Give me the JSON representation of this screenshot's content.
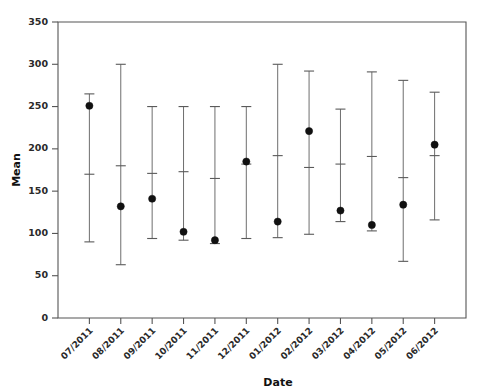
{
  "chart_data": {
    "type": "scatter",
    "title": "",
    "xlabel": "Date",
    "ylabel": "Mean",
    "grid": false,
    "legend": null,
    "ylim": [
      0,
      350
    ],
    "ytick_step": 50,
    "yticks": [
      0,
      50,
      100,
      150,
      200,
      250,
      300,
      350
    ],
    "ytick_labels": [
      "0",
      "50",
      "100",
      "150",
      "200",
      "250",
      "300",
      "350"
    ],
    "categories": [
      "07/2011",
      "08/2011",
      "09/2011",
      "10/2011",
      "11/2011",
      "12/2011",
      "01/2012",
      "02/2012",
      "03/2012",
      "04/2012",
      "05/2012",
      "06/2012"
    ],
    "series": [
      {
        "name": "Mean",
        "values": [
          251,
          132,
          141,
          102,
          92,
          185,
          114,
          221,
          127,
          110,
          134,
          205
        ]
      },
      {
        "name": "Upper whisker",
        "values": [
          265,
          300,
          250,
          250,
          250,
          250,
          300,
          292,
          247,
          291,
          281,
          267
        ]
      },
      {
        "name": "Lower whisker",
        "values": [
          90,
          63,
          94,
          92,
          88,
          94,
          95,
          99,
          114,
          103,
          67,
          116
        ]
      },
      {
        "name": "Inner cap",
        "values": [
          170,
          180,
          171,
          173,
          165,
          182,
          192,
          178,
          182,
          191,
          166,
          192
        ]
      }
    ],
    "point_count": 12,
    "marker": "filled-circle",
    "marker_color": "#111111",
    "line_color": "#6e6e6e"
  },
  "axes": {
    "y_title": "Mean",
    "x_title": "Date"
  }
}
